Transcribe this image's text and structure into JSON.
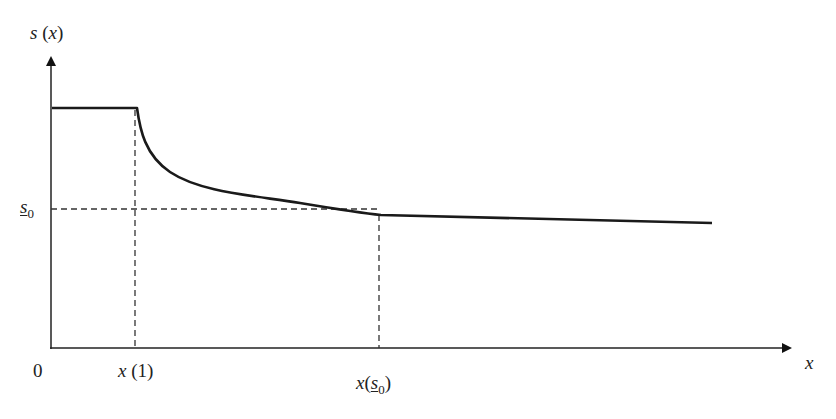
{
  "diagram": {
    "type": "piecewise function plot",
    "y_axis_label": {
      "fn": "s",
      "arg": "x"
    },
    "x_axis_label": "x",
    "origin_label": "0",
    "y_reference_label": {
      "base": "s",
      "sub": "0",
      "underlined": true
    },
    "x_ticks": [
      {
        "fn": "x",
        "arg": "1"
      },
      {
        "fn": "x",
        "arg_base": "s",
        "arg_sub": "0",
        "underlined": true
      }
    ],
    "curve_description": "Constant high value until x(1), then convex decay to s0 at x(s0), then nearly flat slow decline",
    "colors": {
      "curve": "#1a1a1a",
      "axis": "#222222",
      "dashed": "#333333"
    }
  }
}
